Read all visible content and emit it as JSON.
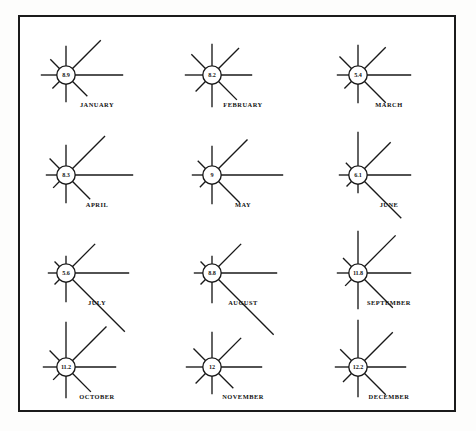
{
  "figure": {
    "frame": {
      "border_color": "#1b1b1b",
      "background": "#ffffff"
    },
    "line_color": "#191919",
    "text_color": "#111111",
    "columns": 3,
    "rows": 4,
    "ray_directions": [
      "N",
      "NE",
      "E",
      "SE",
      "S",
      "SW",
      "W",
      "NW"
    ]
  },
  "roses": [
    {
      "label": "JANUARY",
      "center_value": "8.9",
      "rays": {
        "N": 20,
        "NE": 40,
        "E": 48,
        "SE": 21,
        "S": 18,
        "SW": 10,
        "W": 16,
        "NW": 13
      }
    },
    {
      "label": "FEBRUARY",
      "center_value": "8.2",
      "rays": {
        "N": 22,
        "NE": 29,
        "E": 31,
        "SE": 26,
        "S": 23,
        "SW": 14,
        "W": 18,
        "NW": 20
      }
    },
    {
      "label": "MARCH",
      "center_value": "5.4",
      "rays": {
        "N": 21,
        "NE": 30,
        "E": 44,
        "SE": 30,
        "S": 19,
        "SW": 10,
        "W": 12,
        "NW": 17
      }
    },
    {
      "label": "APRIL",
      "center_value": "8.3",
      "rays": {
        "N": 21,
        "NE": 46,
        "E": 58,
        "SE": 25,
        "S": 19,
        "SW": 9,
        "W": 11,
        "NW": 14
      }
    },
    {
      "label": "MAY",
      "center_value": "9",
      "rays": {
        "N": 20,
        "NE": 41,
        "E": 62,
        "SE": 30,
        "S": 20,
        "SW": 8,
        "W": 11,
        "NW": 11
      }
    },
    {
      "label": "JUNE",
      "center_value": "6.1",
      "rays": {
        "N": 34,
        "NE": 37,
        "E": 44,
        "SE": 52,
        "S": 9,
        "SW": 7,
        "W": 10,
        "NW": 8
      }
    },
    {
      "label": "JULY",
      "center_value": "5.6",
      "rays": {
        "N": 8,
        "NE": 32,
        "E": 54,
        "SE": 74,
        "S": 20,
        "SW": 7,
        "W": 9,
        "NW": 7
      }
    },
    {
      "label": "AUGUST",
      "center_value": "8.8",
      "rays": {
        "N": 8,
        "NE": 32,
        "E": 56,
        "SE": 78,
        "S": 21,
        "SW": 7,
        "W": 9,
        "NW": 7
      }
    },
    {
      "label": "SEPTEMBER",
      "center_value": "11.8",
      "rays": {
        "N": 33,
        "NE": 44,
        "E": 44,
        "SE": 40,
        "S": 27,
        "SW": 9,
        "W": 12,
        "NW": 12
      }
    },
    {
      "label": "OCTOBER",
      "center_value": "11.2",
      "rays": {
        "N": 36,
        "NE": 48,
        "E": 41,
        "SE": 26,
        "S": 22,
        "SW": 9,
        "W": 14,
        "NW": 14
      }
    },
    {
      "label": "NOVEMBER",
      "center_value": "12",
      "rays": {
        "N": 26,
        "NE": 32,
        "E": 41,
        "SE": 21,
        "S": 18,
        "SW": 14,
        "W": 17,
        "NW": 17
      }
    },
    {
      "label": "DECEMBER",
      "center_value": "12.2",
      "rays": {
        "N": 38,
        "NE": 40,
        "E": 39,
        "SE": 30,
        "S": 21,
        "SW": 12,
        "W": 14,
        "NW": 16
      }
    }
  ]
}
